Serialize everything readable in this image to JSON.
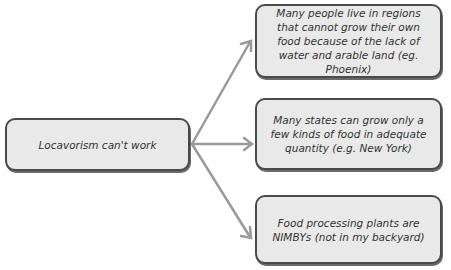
{
  "diagram": {
    "root": {
      "label": "Locavorism can't work"
    },
    "children": [
      {
        "label": "Many people live in regions that cannot grow their own food because of the lack of water and arable land (eg. Phoenix)"
      },
      {
        "label": "Many states can grow only a few kinds of food in adequate quantity (e.g. New York)"
      },
      {
        "label": "Food processing plants are NIMBYs (not in my backyard)"
      }
    ],
    "colors": {
      "box_fill": "#e9e9e9",
      "box_border": "#4a4a4a",
      "arrow": "#9a9a9a",
      "text": "#333333"
    }
  }
}
